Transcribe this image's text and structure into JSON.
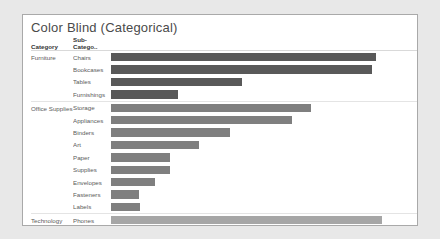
{
  "chart": {
    "title": "Color Blind (Categorical)",
    "columns": {
      "category": "Category",
      "subcategory": "Sub-Catego.."
    },
    "axis_title": "Sales"
  },
  "chart_data": {
    "type": "bar",
    "orientation": "horizontal",
    "title": "Color Blind (Categorical)",
    "xlabel": "Sales",
    "ylabel": "",
    "xlim": [
      0,
      1700000
    ],
    "grid": false,
    "legend": "none",
    "tick_labels": [
      "0K",
      "100K",
      "200K",
      "300K",
      "400K",
      "500K",
      "600K",
      "700K",
      "800K",
      "900K",
      "1000K",
      "1100K",
      "1200K",
      "1300K",
      "1400K",
      "1500K",
      "1600K",
      "1700K"
    ],
    "tick_values": [
      0,
      100000,
      200000,
      300000,
      400000,
      500000,
      600000,
      700000,
      800000,
      900000,
      1000000,
      1100000,
      1200000,
      1300000,
      1400000,
      1500000,
      1600000,
      1700000
    ],
    "groups": [
      {
        "category": "Furniture",
        "color": "#595959",
        "categories": [
          "Chairs",
          "Bookcases",
          "Tables",
          "Furnishings"
        ],
        "values": [
          1470000,
          1450000,
          730000,
          375000
        ]
      },
      {
        "category": "Office Supplies",
        "color": "#7f7f7f",
        "categories": [
          "Storage",
          "Appliances",
          "Binders",
          "Art",
          "Paper",
          "Supplies",
          "Envelopes",
          "Fasteners",
          "Labels"
        ],
        "values": [
          1110000,
          1005000,
          660000,
          490000,
          325000,
          330000,
          245000,
          155000,
          160000
        ]
      },
      {
        "category": "Technology",
        "color": "#a6a6a6",
        "categories": [
          "Phones",
          "Copiers",
          "Machines",
          "Accessories"
        ],
        "values": [
          1505000,
          1435000,
          750000,
          710000
        ]
      }
    ]
  }
}
